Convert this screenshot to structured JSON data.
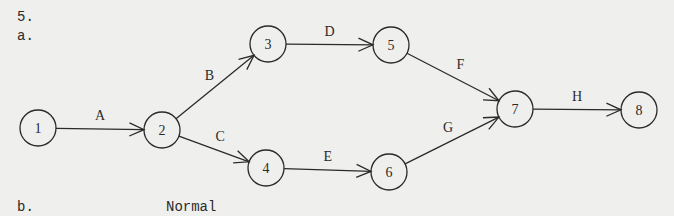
{
  "headings": {
    "problem_number": "5.",
    "part_a": "a.",
    "part_b": "b.",
    "part_b_column": "Normal"
  },
  "diagram": {
    "type": "activity-on-arrow network",
    "nodes": [
      {
        "id": "1",
        "label": "1",
        "x": 38,
        "y": 128
      },
      {
        "id": "2",
        "label": "2",
        "x": 162,
        "y": 130
      },
      {
        "id": "3",
        "label": "3",
        "x": 268,
        "y": 44
      },
      {
        "id": "4",
        "label": "4",
        "x": 266,
        "y": 168
      },
      {
        "id": "5",
        "label": "5",
        "x": 391,
        "y": 45
      },
      {
        "id": "6",
        "label": "6",
        "x": 389,
        "y": 172
      },
      {
        "id": "7",
        "label": "7",
        "x": 515,
        "y": 109
      },
      {
        "id": "8",
        "label": "8",
        "x": 639,
        "y": 110
      }
    ],
    "edges": [
      {
        "activity": "A",
        "from": "1",
        "to": "2"
      },
      {
        "activity": "B",
        "from": "2",
        "to": "3"
      },
      {
        "activity": "C",
        "from": "2",
        "to": "4"
      },
      {
        "activity": "D",
        "from": "3",
        "to": "5"
      },
      {
        "activity": "E",
        "from": "4",
        "to": "6"
      },
      {
        "activity": "F",
        "from": "5",
        "to": "7"
      },
      {
        "activity": "G",
        "from": "6",
        "to": "7"
      },
      {
        "activity": "H",
        "from": "7",
        "to": "8"
      }
    ]
  }
}
